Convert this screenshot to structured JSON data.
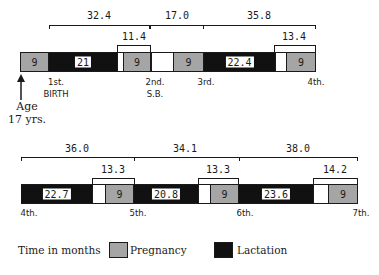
{
  "diagram": {
    "row1": {
      "spans": [
        {
          "label": "32.4",
          "x0": 49,
          "x1": 150
        },
        {
          "label": "17.0",
          "x0": 150,
          "x1": 203
        },
        {
          "label": "35.8",
          "x0": 203,
          "x1": 315
        }
      ],
      "sub_spans": [
        {
          "label": "11.4",
          "x0": 117,
          "x1": 150
        },
        {
          "label": "13.4",
          "x0": 274,
          "x1": 315
        }
      ],
      "segments": [
        {
          "type": "pregnancy",
          "label": "9"
        },
        {
          "type": "lactation",
          "label": "21"
        },
        {
          "type": "interval",
          "label": ""
        },
        {
          "type": "pregnancy",
          "label": "9"
        },
        {
          "type": "interval",
          "label": ""
        },
        {
          "type": "pregnancy",
          "label": "9"
        },
        {
          "type": "lactation",
          "label": "22.4"
        },
        {
          "type": "interval",
          "label": ""
        },
        {
          "type": "pregnancy",
          "label": "9"
        }
      ],
      "events": [
        {
          "line1": "1st.",
          "line2": "BIRTH"
        },
        {
          "line1": "2nd.",
          "line2": "S.B."
        },
        {
          "line1": "3rd.",
          "line2": ""
        },
        {
          "line1": "4th.",
          "line2": ""
        }
      ],
      "start_marker": {
        "line1": "Age",
        "line2": "17 yrs."
      }
    },
    "row2": {
      "spans": [
        {
          "label": "36.0"
        },
        {
          "label": "34.1"
        },
        {
          "label": "38.0"
        }
      ],
      "sub_spans": [
        {
          "label": "13.3"
        },
        {
          "label": "13.3"
        },
        {
          "label": "14.2"
        }
      ],
      "segments": [
        {
          "type": "lactation",
          "label": "22.7"
        },
        {
          "type": "interval",
          "label": ""
        },
        {
          "type": "pregnancy",
          "label": "9"
        },
        {
          "type": "lactation",
          "label": "20.8"
        },
        {
          "type": "interval",
          "label": ""
        },
        {
          "type": "pregnancy",
          "label": "9"
        },
        {
          "type": "lactation",
          "label": "23.6"
        },
        {
          "type": "interval",
          "label": ""
        },
        {
          "type": "pregnancy",
          "label": "9"
        }
      ],
      "events": [
        {
          "line1": "4th."
        },
        {
          "line1": "5th."
        },
        {
          "line1": "6th."
        },
        {
          "line1": "7th."
        }
      ]
    },
    "legend": {
      "caption": "Time in months",
      "items": [
        {
          "label": "Pregnancy",
          "type": "pregnancy"
        },
        {
          "label": "Lactation",
          "type": "lactation"
        }
      ]
    },
    "colors": {
      "lactation": "#111111",
      "pregnancy": "#d8d8d8",
      "interval": "#ffffff"
    }
  }
}
